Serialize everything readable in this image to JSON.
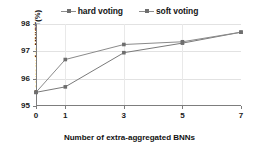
{
  "chart_data": {
    "type": "line",
    "title": "",
    "xlabel": "Number of extra-aggregated BNNs",
    "ylabel": "Accuracy for MNIST(%)",
    "x": [
      0,
      1,
      3,
      5,
      7
    ],
    "xtick_labels": [
      "0",
      "1",
      "3",
      "5",
      "7"
    ],
    "ytick_labels": [
      "95",
      "96",
      "97",
      "98"
    ],
    "yticks": [
      95,
      96,
      97,
      98
    ],
    "xlim": [
      0,
      7
    ],
    "ylim": [
      95,
      98
    ],
    "grid": "horizontal-and-vertical-light",
    "legend_position": "top-center",
    "series": [
      {
        "name": "hard voting",
        "color": "#7a7a7a",
        "marker": "square",
        "values": [
          95.5,
          95.7,
          96.95,
          97.3,
          97.7
        ]
      },
      {
        "name": "soft voting",
        "color": "#8a8a8a",
        "marker": "square",
        "values": [
          95.5,
          96.7,
          97.25,
          97.35,
          97.7
        ]
      }
    ]
  },
  "legend": {
    "entries": [
      {
        "label": "hard voting"
      },
      {
        "label": "soft voting"
      }
    ]
  },
  "colors": {
    "axis": "#7d7d7d",
    "grid": "#e2e2e2",
    "text": "#161616",
    "series_1": "#7a7a7a",
    "series_2": "#8a8a8a",
    "background": "#ffffff"
  }
}
